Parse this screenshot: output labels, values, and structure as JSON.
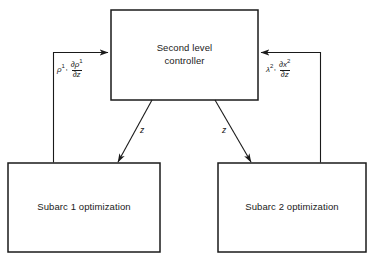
{
  "diagram": {
    "type": "block-diagram",
    "stroke_color": "#1a1a1a",
    "background_color": "#ffffff",
    "text_color": "#1a1a1a",
    "boxes": [
      {
        "id": "second-level-controller",
        "label": "Second level\ncontroller",
        "x": 111,
        "y": 10,
        "width": 147,
        "height": 90
      },
      {
        "id": "subarc-1-optimization",
        "label": "Subarc 1 optimization",
        "x": 8,
        "y": 163,
        "width": 152,
        "height": 89
      },
      {
        "id": "subarc-2-optimization",
        "label": "Subarc 2 optimization",
        "x": 218,
        "y": 163,
        "width": 148,
        "height": 89
      }
    ],
    "arrows": [
      {
        "id": "controller-to-subarc-1",
        "label": "z",
        "from": "second-level-controller",
        "to": "subarc-1-optimization",
        "direction": "down-left",
        "arrowhead": true
      },
      {
        "id": "controller-to-subarc-2",
        "label": "z",
        "from": "second-level-controller",
        "to": "subarc-2-optimization",
        "direction": "down-right",
        "arrowhead": true
      },
      {
        "id": "subarc-1-to-controller",
        "from": "subarc-1-optimization",
        "to": "second-level-controller",
        "direction": "up-then-right",
        "arrowhead": true,
        "label_parts": {
          "symbol": "ρ",
          "symbol_sup": "1",
          "separator": ",",
          "numerator": "∂ρ",
          "numerator_sup": "1",
          "denominator": "∂z"
        }
      },
      {
        "id": "subarc-2-to-controller",
        "from": "subarc-2-optimization",
        "to": "second-level-controller",
        "direction": "up-then-left",
        "arrowhead": true,
        "label_parts": {
          "symbol": "λ",
          "symbol_sup": "2",
          "separator": ",",
          "numerator": "∂x",
          "numerator_sup": "2",
          "denominator": "∂z"
        }
      }
    ]
  }
}
